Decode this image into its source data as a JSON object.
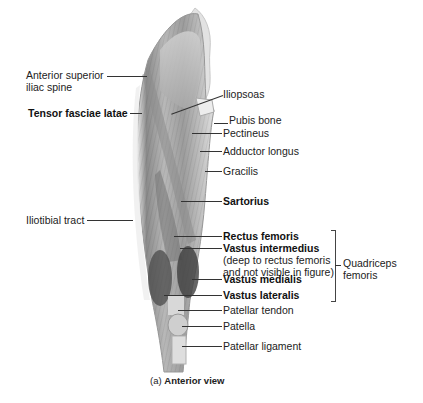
{
  "figure": {
    "caption_prefix": "(a)",
    "caption_title": "Anterior view"
  },
  "labels_left": {
    "anterior_superior_iliac_spine_1": "Anterior superior",
    "anterior_superior_iliac_spine_2": "iliac spine",
    "tensor_fasciae_latae": "Tensor fasciae latae",
    "iliotibial_tract": "Iliotibial tract"
  },
  "labels_right": {
    "iliopsoas": "Iliopsoas",
    "pubis_bone": "Pubis bone",
    "pectineus": "Pectineus",
    "adductor_longus": "Adductor longus",
    "gracilis": "Gracilis",
    "sartorius": "Sartorius",
    "rectus_femoris": "Rectus femoris",
    "vastus_intermedius": "Vastus intermedius",
    "vastus_intermedius_note_1": "(deep to rectus femoris",
    "vastus_intermedius_note_2": "and not visible in figure)",
    "vastus_medialis": "Vastus medialis",
    "vastus_lateralis": "Vastus lateralis",
    "patellar_tendon": "Patellar tendon",
    "patella": "Patella",
    "patellar_ligament": "Patellar ligament"
  },
  "group": {
    "quadriceps_1": "Quadriceps",
    "quadriceps_2": "femoris"
  },
  "colors": {
    "muscle_dark": "#5a5a5a",
    "muscle_mid": "#9a9a9a",
    "muscle_light": "#d6d6d6",
    "leader_line": "#333333"
  }
}
